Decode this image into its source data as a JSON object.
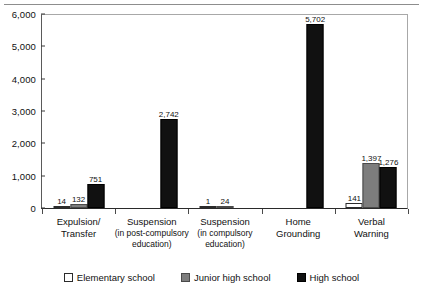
{
  "chart_data": {
    "type": "bar",
    "title": "",
    "subtitle": "",
    "xlabel": "",
    "ylabel": "",
    "ylim": [
      0,
      6000
    ],
    "ytick_labels": [
      "0",
      "1,000",
      "2,000",
      "3,000",
      "4,000",
      "5,000",
      "6,000"
    ],
    "ytick_values": [
      0,
      1000,
      2000,
      3000,
      4000,
      5000,
      6000
    ],
    "grid": false,
    "legend_position": "bottom",
    "categories": [
      {
        "line1": "Expulsion/",
        "line2": "Transfer",
        "line3": ""
      },
      {
        "line1": "Suspension",
        "line2": "(in post-compulsory",
        "line3": "education)"
      },
      {
        "line1": "Suspension",
        "line2": "(in compulsory",
        "line3": "education)"
      },
      {
        "line1": "Home",
        "line2": "Grounding",
        "line3": ""
      },
      {
        "line1": "Verbal",
        "line2": "Warning",
        "line3": ""
      }
    ],
    "series": [
      {
        "name": "Elementary school",
        "color": "#ffffff",
        "values": [
          14,
          null,
          1,
          null,
          141
        ],
        "labels": [
          "14",
          "",
          "1",
          "",
          "141"
        ]
      },
      {
        "name": "Junior high school",
        "color": "#7d7d7d",
        "values": [
          132,
          null,
          24,
          null,
          1397
        ],
        "labels": [
          "132",
          "",
          "24",
          "",
          "1,397"
        ]
      },
      {
        "name": "High school",
        "color": "#111111",
        "values": [
          751,
          2742,
          null,
          5702,
          1276
        ],
        "labels": [
          "751",
          "2,742",
          "",
          "5,702",
          "1,276"
        ]
      }
    ]
  }
}
